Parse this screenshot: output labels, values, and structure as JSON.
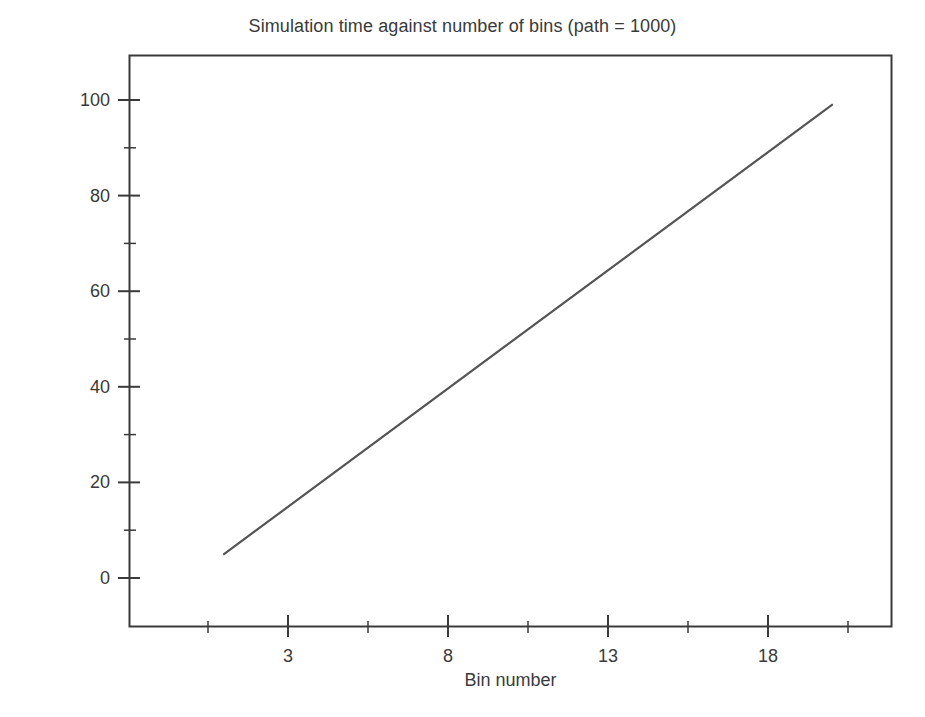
{
  "chart_data": {
    "type": "line",
    "title": "Simulation time against number of bins (path = 1000)",
    "xlabel": "Bin number",
    "ylabel": "Simulation time",
    "x": [
      1,
      20
    ],
    "values": [
      5,
      99
    ],
    "series": [
      {
        "name": "Simulation time",
        "x": [
          1,
          20
        ],
        "values": [
          5,
          99
        ]
      }
    ],
    "xlim": [
      -1.0,
      22.9
    ],
    "ylim": [
      -15,
      111
    ],
    "xticks": [
      3,
      8,
      13,
      18
    ],
    "xtick_labels": [
      "3",
      "8",
      "13",
      "18"
    ],
    "yticks": [
      0,
      20,
      40,
      60,
      80,
      100
    ],
    "ytick_labels": [
      "0",
      "20",
      "40",
      "60",
      "80",
      "100"
    ],
    "x_minor_ticks": [
      0.5,
      5.5,
      10.5,
      15.5,
      20.5
    ],
    "y_minor_ticks": [
      10,
      30,
      50,
      70,
      90
    ],
    "grid": false,
    "legend": null,
    "line_color": "#555555",
    "axis_color": "#3a3a3a",
    "background": "#ffffff"
  }
}
